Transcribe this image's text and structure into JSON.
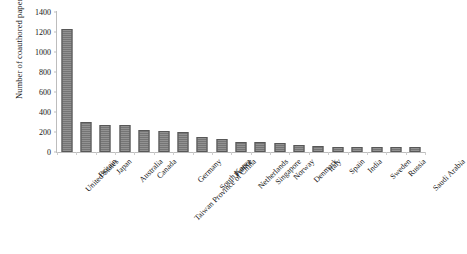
{
  "chart_data": {
    "type": "bar",
    "title": "",
    "xlabel": "",
    "ylabel": "Number of coauthored papers published",
    "ylim": [
      0,
      1400
    ],
    "ytick_step": 200,
    "yticks": [
      0,
      200,
      400,
      600,
      800,
      1000,
      1200,
      1400
    ],
    "grid": false,
    "legend": false,
    "bar_color": "#7c7c7c",
    "bar_edge_color": "#575757",
    "axis_color": "#bdbdbd",
    "categories": [
      "United States",
      "Britain",
      "Japan",
      "Australia",
      "Canada",
      "Taiwan Province of China",
      "Germany",
      "South Korea",
      "France",
      "Netherlands",
      "Singapore",
      "Norway",
      "Denmark",
      "Italy",
      "Spain",
      "India",
      "Sweden",
      "Russia",
      "Saudi Arabia"
    ],
    "values": [
      1230,
      300,
      270,
      270,
      220,
      210,
      200,
      150,
      135,
      105,
      100,
      95,
      70,
      60,
      55,
      55,
      50,
      50,
      50
    ]
  }
}
